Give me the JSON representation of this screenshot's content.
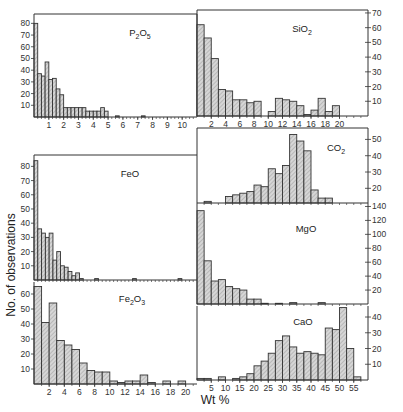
{
  "figure": {
    "xlabel": "Wt %",
    "ylabel": "No. of observations",
    "fill_color": "#c8c8c8",
    "line_color": "#333333"
  },
  "chart_data": [
    {
      "type": "bar",
      "title": "P2O5",
      "label_main": "P",
      "label_sub1": "2",
      "label_mid": "O",
      "label_sub2": "5",
      "xlabel": "Wt %",
      "ylabel": "No. of observations",
      "bin_width": 0.25,
      "x_start": 0,
      "xticks": [
        1,
        2,
        3,
        4,
        5,
        6,
        7,
        8,
        9,
        10
      ],
      "yticks": [
        10,
        20,
        30,
        40,
        50,
        60,
        70,
        80
      ],
      "xlim": [
        0,
        11
      ],
      "ylim": [
        0,
        88
      ],
      "values": [
        80,
        37,
        35,
        47,
        32,
        33,
        24,
        19,
        8,
        8,
        8,
        8,
        8,
        8,
        5,
        5,
        5,
        5,
        8,
        5,
        0,
        0,
        1,
        0,
        0,
        0,
        0,
        0,
        0,
        1,
        0,
        0,
        0,
        0,
        0,
        0,
        0,
        0,
        0,
        0,
        0,
        0,
        0,
        0
      ],
      "yaxis_side": "left"
    },
    {
      "type": "bar",
      "title": "SiO2",
      "label_main": "Si",
      "label_sub1": "",
      "label_mid": "O",
      "label_sub2": "2",
      "xlabel": "Wt %",
      "ylabel": "No. of observations",
      "bin_width": 1,
      "x_start": 0,
      "xticks": [
        2,
        4,
        6,
        8,
        10,
        12,
        14,
        16,
        18,
        20
      ],
      "yticks": [
        10,
        20,
        30,
        40,
        50,
        60,
        70
      ],
      "xlim": [
        0,
        24
      ],
      "ylim": [
        0,
        72
      ],
      "values": [
        62,
        53,
        39,
        18,
        17,
        11,
        11,
        9,
        10,
        0,
        3,
        12,
        11,
        10,
        7,
        1,
        4,
        12,
        3,
        7,
        0,
        0,
        0,
        0
      ],
      "yaxis_side": "right"
    },
    {
      "type": "bar",
      "title": "CO2",
      "label_main": "C",
      "label_sub1": "",
      "label_mid": "O",
      "label_sub2": "2",
      "xlabel": "Wt %",
      "ylabel": "No. of observations",
      "bin_width": 1,
      "x_start": 0,
      "xticks": [],
      "yticks": [
        20,
        30,
        40,
        50
      ],
      "xlim": [
        0,
        24
      ],
      "ylim": [
        11,
        57
      ],
      "values": [
        0,
        12,
        0,
        0,
        15,
        16,
        17,
        18,
        22,
        21,
        32,
        29,
        34,
        53,
        49,
        43,
        19,
        14,
        14,
        0,
        0,
        0,
        0,
        0
      ],
      "yaxis_side": "right"
    },
    {
      "type": "bar",
      "title": "MgO",
      "label_main": "MgO",
      "label_sub1": "",
      "label_mid": "",
      "label_sub2": "",
      "xlabel": "Wt %",
      "ylabel": "No. of observations",
      "bin_width": 1,
      "x_start": 0,
      "xticks": [],
      "yticks": [
        20,
        40,
        60,
        80,
        100,
        120,
        140
      ],
      "xlim": [
        0,
        24
      ],
      "ylim": [
        0,
        145
      ],
      "values": [
        134,
        62,
        33,
        35,
        25,
        22,
        20,
        7,
        7,
        1,
        0,
        1,
        0,
        2,
        0,
        0,
        0,
        2,
        0,
        0,
        0,
        0,
        0,
        0
      ],
      "yaxis_side": "right"
    },
    {
      "type": "bar",
      "title": "FeO",
      "label_main": "FeO",
      "label_sub1": "",
      "label_mid": "",
      "label_sub2": "",
      "xlabel": "Wt %",
      "ylabel": "No. of observations",
      "bin_width": 0.5,
      "x_start": 0,
      "xticks": [],
      "yticks": [
        10,
        20,
        30,
        40,
        50,
        60,
        70,
        80
      ],
      "xlim": [
        0,
        21.5
      ],
      "ylim": [
        0,
        88
      ],
      "values": [
        84,
        36,
        33,
        30,
        33,
        14,
        20,
        10,
        9,
        6,
        3,
        5,
        1,
        0,
        0,
        0,
        1,
        0,
        0,
        0,
        0,
        0,
        0,
        0,
        0,
        0,
        1,
        0,
        0,
        0,
        0,
        0,
        0,
        0,
        0,
        0,
        0,
        0,
        1,
        0,
        0,
        0,
        0
      ],
      "yaxis_side": "left"
    },
    {
      "type": "bar",
      "title": "Fe2O3",
      "label_main": "Fe",
      "label_sub1": "2",
      "label_mid": "O",
      "label_sub2": "3",
      "xlabel": "Wt %",
      "ylabel": "No. of observations",
      "bin_width": 1,
      "x_start": 0,
      "xticks": [
        2,
        4,
        6,
        8,
        10,
        12,
        14,
        16,
        18,
        20
      ],
      "yticks": [
        10,
        20,
        30,
        40,
        50,
        60
      ],
      "xlim": [
        0,
        21.5
      ],
      "ylim": [
        0,
        68
      ],
      "values": [
        65,
        41,
        54,
        29,
        26,
        23,
        14,
        9,
        8,
        8,
        2,
        1,
        2,
        2,
        6,
        1,
        0,
        2,
        0,
        2,
        0,
        0
      ],
      "yaxis_side": "left"
    },
    {
      "type": "bar",
      "title": "CaO",
      "label_main": "CaO",
      "label_sub1": "",
      "label_mid": "",
      "label_sub2": "",
      "xlabel": "Wt %",
      "ylabel": "No. of observations",
      "bin_width": 2.5,
      "x_start": 0,
      "xticks": [
        5,
        10,
        15,
        20,
        25,
        30,
        35,
        40,
        45,
        50,
        55
      ],
      "yticks": [
        10,
        20,
        30,
        40
      ],
      "xlim": [
        0,
        60
      ],
      "ylim": [
        0,
        47
      ],
      "values": [
        1,
        1,
        0,
        2,
        0,
        1,
        2,
        4,
        9,
        12,
        17,
        25,
        28,
        21,
        17,
        18,
        17,
        16,
        33,
        32,
        46,
        20,
        2
      ],
      "yaxis_side": "right"
    }
  ]
}
